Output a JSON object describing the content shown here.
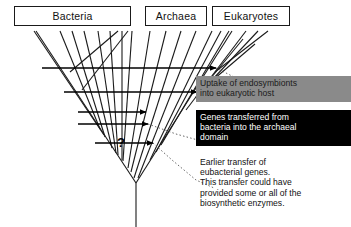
{
  "diagram": {
    "domains": [
      {
        "id": "bacteria",
        "label": "Bacteria"
      },
      {
        "id": "archaea",
        "label": "Archaea"
      },
      {
        "id": "eukaryotes",
        "label": "Eukaryotes"
      }
    ],
    "annotations": {
      "question_mark": "?"
    },
    "callouts": [
      {
        "id": "endosymbiont",
        "text": "Uptake of endosymbionts\ninto eukaryotic host",
        "background": "#8a8a8a",
        "color": "#1b1b1b"
      },
      {
        "id": "genes-transferred",
        "text": "Genes transferred from\nbacteria into the archaeal\ndomain",
        "background": "#000000",
        "color": "#ffffff"
      },
      {
        "id": "earlier-transfer",
        "text": "Earlier transfer of\neubacterial genes.\nThis transfer could have\nprovided some or all of the\nbiosynthetic enzymes.",
        "background": "transparent",
        "color": "#111111"
      }
    ],
    "colors": {
      "line": "#1a1a1a",
      "page_background": "#ffffff",
      "box_border": "#1a1a1a"
    }
  }
}
